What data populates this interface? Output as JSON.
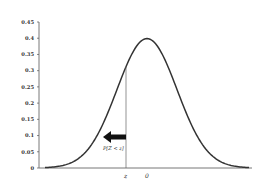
{
  "chart_data": {
    "type": "line",
    "title": "",
    "xlabel": "",
    "ylabel": "",
    "ylim": [
      0,
      0.45
    ],
    "yticks": [
      0,
      0.05,
      0.1,
      0.15,
      0.2,
      0.25,
      0.3,
      0.35,
      0.4,
      0.45
    ],
    "ytick_labels": [
      "0",
      "0.05",
      "0.1",
      "0.15",
      "0.2",
      "0.25",
      "0.3",
      "0.35",
      "0.4",
      "0.45"
    ],
    "xtick_labels": [
      "z",
      "0"
    ],
    "xlim": [
      -3.4,
      3.4
    ],
    "grid": false,
    "series": [
      {
        "name": "standard normal pdf",
        "x": [
          -3.4,
          -3.0,
          -2.5,
          -2.0,
          -1.5,
          -1.0,
          -0.7,
          -0.5,
          0.0,
          0.5,
          1.0,
          1.5,
          2.0,
          2.5,
          3.0,
          3.4
        ],
        "values": [
          0.001,
          0.004,
          0.018,
          0.054,
          0.13,
          0.242,
          0.312,
          0.352,
          0.399,
          0.352,
          0.242,
          0.13,
          0.054,
          0.018,
          0.004,
          0.001
        ]
      }
    ],
    "z_marker": -0.7,
    "annotations": [
      {
        "text": "P[Z < z]",
        "arrow": "left",
        "at_x": "z"
      }
    ]
  },
  "labels": {
    "z": "z",
    "zero": "0",
    "prob": "P[Z < z]"
  }
}
